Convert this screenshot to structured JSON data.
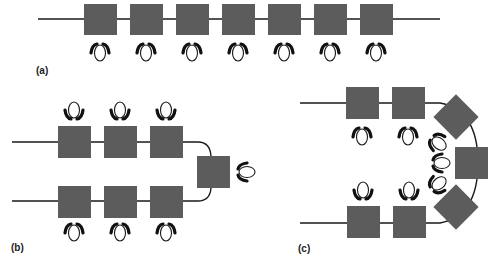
{
  "figure": {
    "panels": [
      {
        "id": "a",
        "label": "(a)",
        "layout": "single straight row",
        "tables": 7,
        "seats": 7,
        "seat_side": "below"
      },
      {
        "id": "b",
        "label": "(b)",
        "layout": "two parallel rows joined by a head table",
        "tables": 7,
        "seats": 7,
        "seat_side": "outside"
      },
      {
        "id": "c",
        "label": "(c)",
        "layout": "U-shape / horseshoe",
        "tables": 7,
        "seats": 7,
        "seat_side": "inside"
      }
    ],
    "colors": {
      "table": "#5c5c5c",
      "line": "#1a1a1a",
      "person_head": "#ffffff",
      "person_arms": "#111111"
    },
    "icons": {
      "table": "square-table-icon",
      "person": "seated-person-icon"
    }
  }
}
